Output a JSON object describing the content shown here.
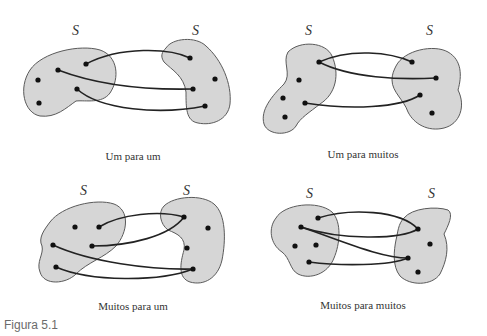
{
  "figure_label": "Figura 5.1",
  "set_symbol": "S",
  "panels": [
    {
      "id": "one-to-one",
      "caption": "Um para um"
    },
    {
      "id": "one-to-many",
      "caption": "Um para muitos"
    },
    {
      "id": "many-to-one",
      "caption": "Muitos para um"
    },
    {
      "id": "many-to-many",
      "caption": "Muitos para muitos"
    }
  ],
  "colors": {
    "blob_fill": "#d6d6d6",
    "blob_stroke": "#5a5a5a",
    "edge": "#222222",
    "dot": "#111111"
  }
}
